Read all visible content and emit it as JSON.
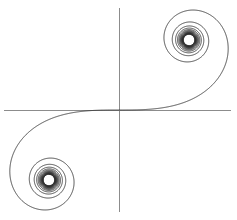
{
  "figure": {
    "width": 237,
    "height": 220,
    "background_color": "#ffffff"
  },
  "chart_data": {
    "type": "line",
    "subtitle": "Parametric plot of the Fresnel integrals",
    "xlabel": "",
    "ylabel": "",
    "grid": false,
    "legend": null,
    "curve_name": "Cornu spiral",
    "parametric": {
      "x_expression": "C(t) = ∫₀ᵗ cos(πu²/2) du",
      "y_expression": "S(t) = ∫₀ᵗ sin(πu²/2) du",
      "t_min": -8.0,
      "t_max": 8.0,
      "samples": 6000
    },
    "convergence_points": [
      {
        "name": "upper-right-limit",
        "x": 0.5,
        "y": 0.5
      },
      {
        "name": "lower-left-limit",
        "x": -0.5,
        "y": -0.5
      }
    ],
    "inflection_point": {
      "name": "origin",
      "x": 0.0,
      "y": 0.0
    },
    "xlim": [
      -0.72,
      0.72
    ],
    "ylim": [
      -0.72,
      0.72
    ],
    "axes": {
      "x_axis_visible": true,
      "y_axis_visible": true,
      "x_axis_data_y": 0,
      "y_axis_data_x": 0,
      "color": "#8c8c8c",
      "width": 1,
      "ticks": [],
      "tick_labels": []
    },
    "series": [
      {
        "name": "Cornu spiral",
        "color": "#2b2b2b",
        "line_width": 0.85,
        "style": "solid"
      }
    ]
  },
  "render": {
    "origin_px": {
      "x": 119,
      "y": 110
    },
    "scale_px_per_unit": 140,
    "x_axis_extent_px": {
      "start": 4,
      "end": 231
    },
    "y_axis_extent_px": {
      "start": 8,
      "end": 212
    }
  }
}
